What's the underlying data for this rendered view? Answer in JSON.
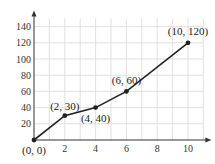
{
  "chart_data": {
    "type": "line",
    "title": "",
    "xlabel": "",
    "ylabel": "",
    "x": [
      0,
      2,
      4,
      6,
      10
    ],
    "series": [
      {
        "name": "data",
        "values": [
          0,
          30,
          40,
          60,
          120
        ]
      }
    ],
    "point_labels": [
      "(0, 0)",
      "(2, 30)",
      "(4, 40)",
      "(6, 60)",
      "(10, 120)"
    ],
    "xlim": [
      0,
      11
    ],
    "ylim": [
      0,
      150
    ],
    "x_ticks": [
      2,
      4,
      6,
      8,
      10
    ],
    "y_ticks": [
      20,
      40,
      60,
      80,
      100,
      120,
      140
    ],
    "grid": true,
    "legend": "none"
  },
  "style": {
    "line_color": "#222222",
    "grid_color": "#d9d9d9",
    "axis_color": "#333333"
  }
}
